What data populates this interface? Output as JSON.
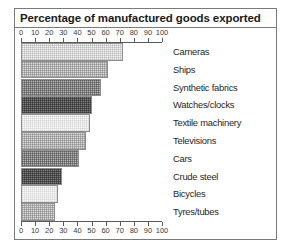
{
  "chart_data": {
    "type": "bar",
    "orientation": "horizontal",
    "title": "Percentage of manufactured goods exported",
    "xlabel": "",
    "ylabel": "",
    "xlim": [
      0,
      100
    ],
    "grid": false,
    "legend": "none",
    "axis_position": "both top and bottom",
    "tick_labels": [
      "0",
      "10",
      "20",
      "30",
      "40",
      "50",
      "60",
      "70",
      "80",
      "90",
      "100"
    ],
    "ticks": [
      0,
      10,
      20,
      30,
      40,
      50,
      60,
      70,
      80,
      90,
      100
    ],
    "categories": [
      "Cameras",
      "Ships",
      "Synthetic fabrics",
      "Watches/clocks",
      "Textile machinery",
      "Televisions",
      "Cars",
      "Crude steel",
      "Bicycles",
      "Tyres/tubes"
    ],
    "values": [
      72,
      62,
      57,
      50,
      49,
      46,
      41,
      29,
      26,
      24
    ],
    "bar_shades": [
      "very-light",
      "light",
      "medium",
      "dark",
      "lightest",
      "light",
      "medium",
      "dark",
      "lightest",
      "light"
    ]
  }
}
